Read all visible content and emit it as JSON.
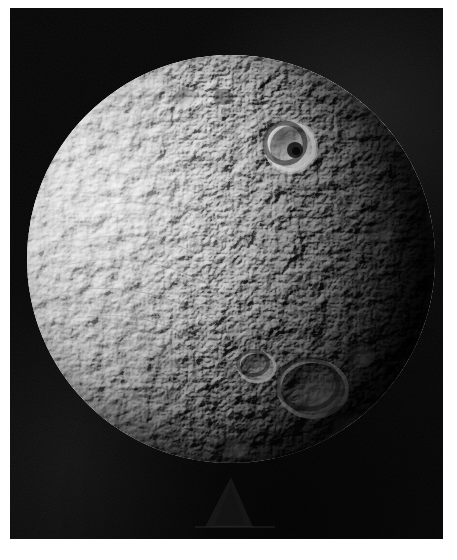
{
  "image": {
    "kind": "astronomical-photograph",
    "medium": "black-and-white print",
    "subject": "icy cratered moon",
    "alt_text": "Black and white spacecraft photograph of a heavily cratered icy moon, lit from the left, with the right limb falling into shadow",
    "border_color": "#ffffff",
    "sky_color": "#040404"
  },
  "frame": {
    "width": 457,
    "height": 560,
    "border_left": 10,
    "border_top": 8,
    "plate_width": 433,
    "plate_height": 531
  },
  "moon": {
    "label": "moon-disk",
    "center_x": 231,
    "center_y": 259,
    "radius": 204,
    "bright_limb": "left",
    "terminator_side": "right",
    "surface_base_color": "#d6d6d6",
    "shadow_color": "#0a0a0a",
    "terrain": "densely cratered highlands with smooth bright western plains"
  },
  "features": [
    {
      "name": "prominent-ring-crater",
      "description": "bright-rimmed crater with dark floor and central pit, upper right quadrant",
      "x": 278,
      "y": 93,
      "radius": 25
    },
    {
      "name": "large-degraded-crater",
      "description": "large shallow crater basin, lower right",
      "x": 300,
      "y": 345,
      "radius": 34
    },
    {
      "name": "twin-crater-pair",
      "description": "pair of overlapping craters near the lower limb",
      "x": 245,
      "y": 320,
      "radius": 20
    },
    {
      "name": "linear-groove-system",
      "description": "faint linear troughs crossing the smooth western plains",
      "x": 95,
      "y": 215,
      "radius": 60
    },
    {
      "name": "plate-artifact",
      "description": "faint dark triangular emulsion artifact below the disk",
      "x": 230,
      "y": 500,
      "radius": 40
    }
  ],
  "lighting": {
    "sun_direction": "upper-left",
    "phase_angle_note": "gibbous, terminator along right limb",
    "highlight_color": "#f2f2f2",
    "midtone_color": "#9a9a9a",
    "shadow_color": "#141414"
  }
}
